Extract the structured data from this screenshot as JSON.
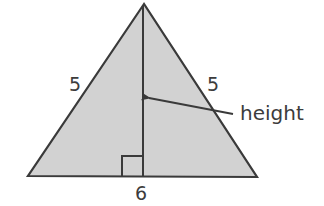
{
  "figure": {
    "type": "isosceles-triangle",
    "labels": {
      "left_side": "5",
      "right_side": "5",
      "base": "6",
      "height_callout": "height"
    },
    "has_right_angle_marker": true,
    "colors": {
      "fill": "#d2d2d2",
      "stroke": "#3a3a3a",
      "text": "#3c3c3c"
    }
  }
}
